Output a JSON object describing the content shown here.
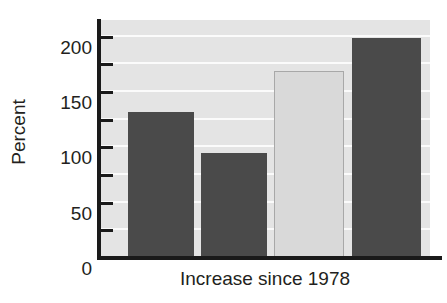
{
  "chart_data": {
    "type": "bar",
    "title": "",
    "subtitle": "",
    "xlabel": "Increase since 1978",
    "ylabel": "Percent",
    "categories": [
      "Bar 1",
      "Bar 2",
      "Bar 3",
      "Bar 4"
    ],
    "values": [
      132,
      95,
      169,
      199
    ],
    "ylim": [
      0,
      215
    ],
    "y_major_ticks": [
      0,
      50,
      100,
      150,
      200
    ],
    "y_minor_ticks": [
      25,
      75,
      125,
      175
    ],
    "y_tick_labels": [
      "0",
      "50",
      "100",
      "150",
      "200"
    ],
    "x_tick_labels": [],
    "grid": "horizontal",
    "legend": "none",
    "bar_colors": [
      "#4a4a4a",
      "#4a4a4a",
      "#d9d9d9",
      "#4a4a4a"
    ],
    "bar_border_colors": [
      "#4a4a4a",
      "#4a4a4a",
      "#a8a8a8",
      "#4a4a4a"
    ],
    "plot_background": "#e4e4e4",
    "gridline_color": "#fbfbfb",
    "axis_color": "#1a1a1a",
    "text_color": "#231f20",
    "bar_geometry_px": [
      {
        "left": 28,
        "width": 66
      },
      {
        "left": 101,
        "width": 66
      },
      {
        "left": 174,
        "width": 70
      },
      {
        "left": 252,
        "width": 69
      }
    ]
  },
  "axis": {
    "y_title": "Percent",
    "x_title": "Increase since 1978"
  }
}
